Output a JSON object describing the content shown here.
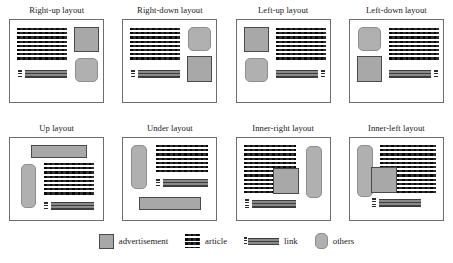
{
  "figure": {
    "caption": "",
    "panel_count": 8,
    "legend_position": "bottom-center"
  },
  "panels": [
    {
      "id": "right-up",
      "title": "Right-up layout",
      "elements": [
        {
          "kind": "article",
          "name": "article-block",
          "x": 4,
          "y": 5,
          "w": 50,
          "h": 33
        },
        {
          "kind": "ad",
          "name": "advertisement-block",
          "x": 61,
          "y": 4,
          "w": 25,
          "h": 25
        },
        {
          "kind": "others",
          "name": "others-block",
          "x": 62,
          "y": 35,
          "w": 23,
          "h": 24
        },
        {
          "kind": "linkdots",
          "name": "link-marker",
          "x": 5,
          "y": 47,
          "w": 4,
          "h": 8
        },
        {
          "kind": "linkbar",
          "name": "link-bar",
          "x": 12,
          "y": 47,
          "w": 42,
          "h": 8
        }
      ]
    },
    {
      "id": "right-down",
      "title": "Right-down layout",
      "elements": [
        {
          "kind": "article",
          "name": "article-block",
          "x": 4,
          "y": 5,
          "w": 50,
          "h": 33
        },
        {
          "kind": "others",
          "name": "others-block",
          "x": 62,
          "y": 4,
          "w": 23,
          "h": 24
        },
        {
          "kind": "ad",
          "name": "advertisement-block",
          "x": 61,
          "y": 33,
          "w": 25,
          "h": 26
        },
        {
          "kind": "linkdots",
          "name": "link-marker",
          "x": 5,
          "y": 47,
          "w": 4,
          "h": 8
        },
        {
          "kind": "linkbar",
          "name": "link-bar",
          "x": 12,
          "y": 47,
          "w": 42,
          "h": 8
        }
      ]
    },
    {
      "id": "left-up",
      "title": "Left-up layout",
      "elements": [
        {
          "kind": "ad",
          "name": "advertisement-block",
          "x": 4,
          "y": 4,
          "w": 25,
          "h": 25
        },
        {
          "kind": "others",
          "name": "others-block",
          "x": 5,
          "y": 35,
          "w": 23,
          "h": 24
        },
        {
          "kind": "article",
          "name": "article-block",
          "x": 36,
          "y": 5,
          "w": 50,
          "h": 33
        },
        {
          "kind": "linkbar",
          "name": "link-bar",
          "x": 36,
          "y": 47,
          "w": 42,
          "h": 8
        },
        {
          "kind": "linkdots",
          "name": "link-marker",
          "x": 81,
          "y": 47,
          "w": 4,
          "h": 8
        }
      ]
    },
    {
      "id": "left-down",
      "title": "Left-down layout",
      "elements": [
        {
          "kind": "others",
          "name": "others-block",
          "x": 5,
          "y": 4,
          "w": 23,
          "h": 24
        },
        {
          "kind": "ad",
          "name": "advertisement-block",
          "x": 4,
          "y": 33,
          "w": 25,
          "h": 26
        },
        {
          "kind": "article",
          "name": "article-block",
          "x": 36,
          "y": 5,
          "w": 50,
          "h": 33
        },
        {
          "kind": "linkbar",
          "name": "link-bar",
          "x": 36,
          "y": 47,
          "w": 42,
          "h": 8
        },
        {
          "kind": "linkdots",
          "name": "link-marker",
          "x": 81,
          "y": 47,
          "w": 4,
          "h": 8
        }
      ]
    },
    {
      "id": "up",
      "title": "Up layout",
      "elements": [
        {
          "kind": "ad",
          "name": "advertisement-block",
          "x": 18,
          "y": 4,
          "w": 56,
          "h": 13
        },
        {
          "kind": "others",
          "name": "others-block",
          "x": 8,
          "y": 23,
          "w": 15,
          "h": 44
        },
        {
          "kind": "article",
          "name": "article-block",
          "x": 31,
          "y": 22,
          "w": 50,
          "h": 33
        },
        {
          "kind": "linkdots",
          "name": "link-marker",
          "x": 31,
          "y": 61,
          "w": 4,
          "h": 8
        },
        {
          "kind": "linkbar",
          "name": "link-bar",
          "x": 38,
          "y": 61,
          "w": 43,
          "h": 8
        }
      ]
    },
    {
      "id": "under",
      "title": "Under layout",
      "elements": [
        {
          "kind": "others",
          "name": "others-block",
          "x": 5,
          "y": 4,
          "w": 16,
          "h": 44
        },
        {
          "kind": "article",
          "name": "article-block",
          "x": 30,
          "y": 4,
          "w": 52,
          "h": 29
        },
        {
          "kind": "linkdots",
          "name": "link-marker",
          "x": 30,
          "y": 38,
          "w": 4,
          "h": 8
        },
        {
          "kind": "linkbar",
          "name": "link-bar",
          "x": 37,
          "y": 38,
          "w": 45,
          "h": 8
        },
        {
          "kind": "ad",
          "name": "advertisement-block",
          "x": 13,
          "y": 56,
          "w": 62,
          "h": 13
        }
      ]
    },
    {
      "id": "inner-right",
      "title": "Inner-right layout",
      "elements": [
        {
          "kind": "article",
          "name": "article-block",
          "x": 4,
          "y": 4,
          "w": 52,
          "h": 50
        },
        {
          "kind": "ad",
          "name": "advertisement-block",
          "x": 33,
          "y": 27,
          "w": 26,
          "h": 26
        },
        {
          "kind": "others",
          "name": "others-block",
          "x": 66,
          "y": 5,
          "w": 16,
          "h": 52
        },
        {
          "kind": "linkdots",
          "name": "link-marker",
          "x": 5,
          "y": 58,
          "w": 4,
          "h": 9
        },
        {
          "kind": "linkbar",
          "name": "link-bar",
          "x": 12,
          "y": 59,
          "w": 44,
          "h": 8
        }
      ]
    },
    {
      "id": "inner-left",
      "title": "Inner-left layout",
      "elements": [
        {
          "kind": "others",
          "name": "others-block",
          "x": 4,
          "y": 4,
          "w": 16,
          "h": 52
        },
        {
          "kind": "article",
          "name": "article-block",
          "x": 27,
          "y": 4,
          "w": 56,
          "h": 50
        },
        {
          "kind": "ad",
          "name": "advertisement-block",
          "x": 18,
          "y": 26,
          "w": 26,
          "h": 26
        },
        {
          "kind": "linkdots",
          "name": "link-marker",
          "x": 19,
          "y": 57,
          "w": 4,
          "h": 9
        },
        {
          "kind": "linkbar",
          "name": "link-bar",
          "x": 26,
          "y": 58,
          "w": 42,
          "h": 8
        }
      ]
    }
  ],
  "legend": {
    "items": [
      {
        "kind": "ad",
        "icon": "advertisement-swatch-icon",
        "label": "advertisement"
      },
      {
        "kind": "article",
        "icon": "article-swatch-icon",
        "label": "article"
      },
      {
        "kind": "link",
        "icon": "link-swatch-icon",
        "label": "link"
      },
      {
        "kind": "others",
        "icon": "others-swatch-icon",
        "label": "others"
      }
    ]
  },
  "colors": {
    "advertisement_fill": "#a8a8a8",
    "advertisement_border": "#4a4a4a",
    "others_fill": "#b0b0b0",
    "others_border": "#8e8e8e",
    "article_dash": "#2c2c2c",
    "link_stripe_light": "#8a8a8a",
    "link_stripe_dark": "#3d3d3d",
    "panel_border": "#6e6e6e",
    "background": "#ffffff",
    "text": "#1a1a1a"
  }
}
